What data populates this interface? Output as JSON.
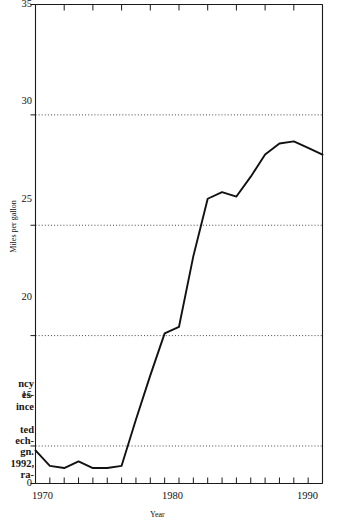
{
  "margin_text": {
    "lines": [
      "ncy",
      "es-",
      "ince",
      "",
      "ted",
      "ech-",
      "gn.",
      "1992,",
      "ra-"
    ]
  },
  "chart_data": {
    "type": "line",
    "title": "",
    "xlabel": "Year",
    "ylabel": "Miles per gallon",
    "xlim": [
      1970,
      1990
    ],
    "ylim": [
      13.3,
      35
    ],
    "y_axis_break": true,
    "y_axis_origin_label": "0",
    "grid": "horizontal-dotted",
    "gridlines": [
      15,
      20,
      25,
      30
    ],
    "legend": "none",
    "x_ticks": [
      1970,
      1971,
      1972,
      1973,
      1974,
      1975,
      1976,
      1977,
      1978,
      1979,
      1980,
      1981,
      1982,
      1983,
      1984,
      1985,
      1986,
      1987,
      1988,
      1989,
      1990
    ],
    "x_tick_labels": [
      "1970",
      "",
      "",
      "",
      "",
      "",
      "",
      "",
      "",
      "",
      "1980",
      "",
      "",
      "",
      "",
      "",
      "",
      "",
      "",
      "",
      "1990"
    ],
    "y_ticks": [
      0,
      15,
      20,
      25,
      30,
      35
    ],
    "y_tick_labels": [
      "0",
      "15",
      "20",
      "25",
      "30",
      "35"
    ],
    "x": [
      1970,
      1971,
      1972,
      1973,
      1974,
      1975,
      1976,
      1977,
      1978,
      1979,
      1980,
      1981,
      1982,
      1983,
      1984,
      1985,
      1986,
      1987,
      1988,
      1989,
      1990
    ],
    "values": [
      14.8,
      14.1,
      14.0,
      14.3,
      14.0,
      14.0,
      14.1,
      16.2,
      18.2,
      20.1,
      20.4,
      23.6,
      26.2,
      26.5,
      26.3,
      27.2,
      28.2,
      28.7,
      28.8,
      28.5,
      28.2
    ],
    "series": [
      {
        "name": "Miles per gallon",
        "color": "#111111",
        "values": [
          14.8,
          14.1,
          14.0,
          14.3,
          14.0,
          14.0,
          14.1,
          16.2,
          18.2,
          20.1,
          20.4,
          23.6,
          26.2,
          26.5,
          26.3,
          27.2,
          28.2,
          28.7,
          28.8,
          28.5,
          28.2
        ]
      }
    ]
  }
}
